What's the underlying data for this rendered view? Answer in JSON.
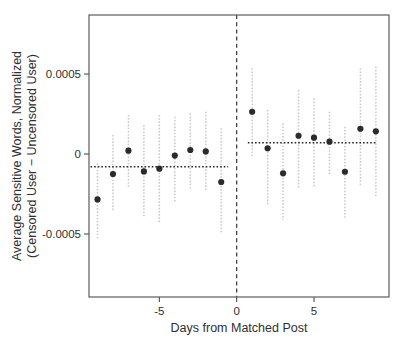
{
  "chart_data": {
    "type": "scatter",
    "title": "",
    "xlabel": "Days from Matched Post",
    "ylabel_lines": [
      "Average Sensitive Words, Normalized",
      "(Censored User − Uncensored User)"
    ],
    "xlim": [
      -9.55,
      9.85
    ],
    "ylim": [
      -0.000894,
      0.000869
    ],
    "x_ticks": [
      {
        "value": -5,
        "label": "-5"
      },
      {
        "value": 0,
        "label": "0"
      },
      {
        "value": 5,
        "label": "5"
      }
    ],
    "y_ticks": [
      {
        "value": 0.0005,
        "label": "0.0005"
      },
      {
        "value": 0,
        "label": "0"
      },
      {
        "value": -0.0005,
        "label": "-0.0005"
      }
    ],
    "reference_line": {
      "x": 0,
      "style": "dashed"
    },
    "mean_lines": [
      {
        "name": "pre-period-mean",
        "y": -8e-05,
        "x_start": -9.45,
        "x_end": -0.55
      },
      {
        "name": "post-period-mean",
        "y": 7e-05,
        "x_start": 0.72,
        "x_end": 9.0
      }
    ],
    "series_name": "Censored minus uncensored users, daily difference",
    "points": [
      {
        "day": -9,
        "value": -0.000284,
        "ci_low": -0.000527,
        "ci_high": -5.8e-05
      },
      {
        "day": -8,
        "value": -0.000125,
        "ci_low": -0.000361,
        "ci_high": 0.000119
      },
      {
        "day": -7,
        "value": 2.1e-05,
        "ci_low": -0.000204,
        "ci_high": 0.000244
      },
      {
        "day": -6,
        "value": -0.000109,
        "ci_low": -0.000392,
        "ci_high": 0.000181
      },
      {
        "day": -5,
        "value": -9.2e-05,
        "ci_low": -0.000433,
        "ci_high": 0.000244
      },
      {
        "day": -4,
        "value": -1e-05,
        "ci_low": -0.000308,
        "ci_high": 0.000233
      },
      {
        "day": -3,
        "value": 2.5e-05,
        "ci_low": -0.000214,
        "ci_high": 0.000254
      },
      {
        "day": -2,
        "value": 1.6e-05,
        "ci_low": -0.000225,
        "ci_high": 0.000264
      },
      {
        "day": -1,
        "value": -0.000175,
        "ci_low": -0.000496,
        "ci_high": 0.000161
      },
      {
        "day": 1,
        "value": 0.000264,
        "ci_low": -1.7e-05,
        "ci_high": 0.000536
      },
      {
        "day": 2,
        "value": 3.6e-05,
        "ci_low": -0.000319,
        "ci_high": 0.000275
      },
      {
        "day": 3,
        "value": -0.000121,
        "ci_low": -0.000413,
        "ci_high": 0.000192
      },
      {
        "day": 4,
        "value": 0.000114,
        "ci_low": -0.000214,
        "ci_high": 0.0004
      },
      {
        "day": 5,
        "value": 0.000102,
        "ci_low": -0.000204,
        "ci_high": 0.000348
      },
      {
        "day": 6,
        "value": 7.7e-05,
        "ci_low": -0.000131,
        "ci_high": 0.000264
      },
      {
        "day": 7,
        "value": -0.000111,
        "ci_low": -0.000402,
        "ci_high": 0.000171
      },
      {
        "day": 8,
        "value": 0.000158,
        "ci_low": -0.000204,
        "ci_high": 0.000536
      },
      {
        "day": 9,
        "value": 0.000142,
        "ci_low": -0.000267,
        "ci_high": 0.000546
      }
    ],
    "colors": {
      "background": "#ffffff",
      "frame": "#5c5c5c",
      "point": "#2b2b2b",
      "error_bar": "#c9c9c9",
      "mean_line": "#2a2a2a",
      "reference_line": "#333333",
      "tick": "#4d4d4d",
      "text": "#2f2f2f"
    },
    "layout": {
      "plot_left": 89,
      "plot_top": 15,
      "plot_width": 300,
      "plot_height": 282,
      "grid": false,
      "legend": "none"
    }
  }
}
